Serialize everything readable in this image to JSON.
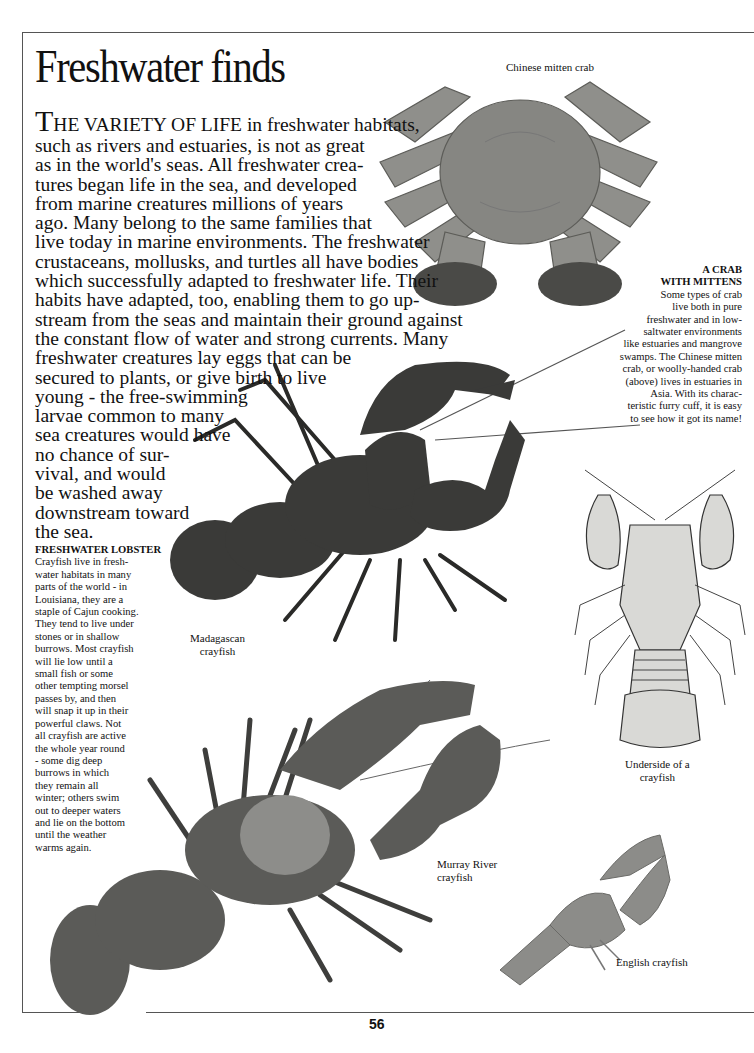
{
  "page": {
    "title": "Freshwater finds",
    "page_number": "56"
  },
  "intro": {
    "dropcap": "T",
    "smallcaps_lead": "HE VARIETY OF LIFE",
    "lines": [
      " in freshwater habitats,",
      "such as rivers and estuaries, is not as great",
      "as in the world's seas. All freshwater crea-",
      "tures began life in the sea, and developed",
      "from marine creatures millions of years",
      "ago.  Many belong to the same families that",
      "live today in marine environments. The freshwater",
      "crustaceans, mollusks, and turtles all have bodies",
      "which successfully adapted to freshwater life. Their",
      "habits have adapted, too, enabling them to go up-",
      "stream from the seas and maintain their ground against",
      "the constant flow of water and strong currents. Many",
      "freshwater creatures lay eggs that can be",
      "secured to plants, or give birth to live",
      "young - the  free-swimming",
      "larvae common to many",
      "sea creatures would have",
      "no chance of sur-",
      "vival, and would",
      "be washed away",
      "downstream toward",
      "the sea."
    ]
  },
  "sidebars": {
    "lobster": {
      "heading": "FRESHWATER LOBSTER",
      "lines": [
        "Crayfish live in fresh-",
        "water habitats in many",
        "parts of the world - in",
        "Louisiana, they are a",
        "staple of Cajun cooking.",
        "They tend to live under",
        "stones or in shallow",
        "burrows.  Most crayfish",
        "will lie low until a",
        "small fish or some",
        "other tempting morsel",
        "passes by,  and then",
        "will snap it up in their",
        "powerful claws. Not",
        "all crayfish are active",
        "the whole year round",
        "- some dig deep",
        "burrows in which",
        "they remain all",
        "winter; others swim",
        "out to deeper waters",
        "and lie on the bottom",
        "until the weather",
        "warms again."
      ]
    },
    "crab": {
      "heading_lines": [
        "A CRAB",
        "WITH MITTENS"
      ],
      "lines": [
        "Some types of crab",
        "live both in pure",
        "freshwater and in low-",
        "saltwater environments",
        "like estuaries and mangrove",
        "swamps.  The Chinese mitten",
        "crab, or woolly-handed crab",
        "(above) lives in estuaries in",
        "Asia.  With its charac-",
        "teristic furry cuff, it is easy",
        "to see how it got its name!"
      ]
    }
  },
  "captions": {
    "chinese_mitten_crab": [
      "Chinese mitten crab"
    ],
    "madagascan_crayfish": [
      "Madagascan",
      "crayfish"
    ],
    "underside_crayfish": [
      "Underside of a",
      "crayfish"
    ],
    "murray_river_crayfish": [
      "Murray River",
      "crayfish"
    ],
    "english_crayfish": [
      "English crayfish"
    ]
  },
  "images": {
    "chinese_mitten_crab": "crab-photo",
    "madagascan_crayfish": "crayfish-photo",
    "underside_crayfish": "crayfish-engraving",
    "murray_river_crayfish": "crayfish-photo",
    "english_crayfish": "crayfish-photo"
  },
  "colors": {
    "frame_line": "#555555",
    "text": "#111111",
    "crab_fill": "#8a8a86",
    "dark_crayfish": "#3a3a38",
    "murray_crayfish": "#5a5a57",
    "english_crayfish": "#8b8b88"
  }
}
